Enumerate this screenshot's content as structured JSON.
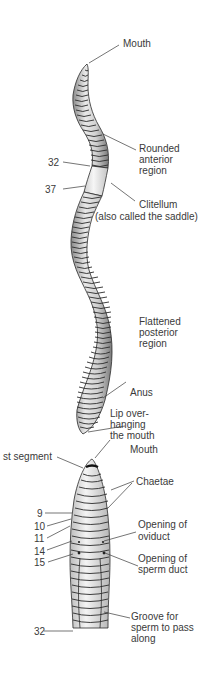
{
  "diagram": {
    "whole_worm": {
      "labels": {
        "mouth": "Mouth",
        "rounded_anterior_1": "Rounded",
        "rounded_anterior_2": "anterior",
        "rounded_anterior_3": "region",
        "segment_32": "32",
        "segment_37": "37",
        "clitellum_1": "Clitellum",
        "clitellum_2": "(also called the saddle)",
        "flattened_posterior_1": "Flattened",
        "flattened_posterior_2": "posterior",
        "flattened_posterior_3": "region",
        "anus": "Anus"
      }
    },
    "anterior_detail": {
      "labels": {
        "lip_1": "Lip over-",
        "lip_2": "hanging",
        "lip_3": "the mouth",
        "mouth": "Mouth",
        "first_segment": "st segment",
        "chaetae": "Chaetae",
        "segment_9": "9",
        "segment_10": "10",
        "segment_11": "11",
        "segment_14": "14",
        "segment_15": "15",
        "oviduct_1": "Opening of",
        "oviduct_2": "oviduct",
        "sperm_duct_1": "Opening of",
        "sperm_duct_2": "sperm duct",
        "segment_32": "32",
        "groove_1": "Groove for",
        "groove_2": "sperm to pass",
        "groove_3": "along"
      }
    },
    "colors": {
      "ink": "#2b2b2b",
      "body_fill": "#c9c9c9",
      "clitellum_fill": "#ececec",
      "background": "#ffffff"
    }
  }
}
